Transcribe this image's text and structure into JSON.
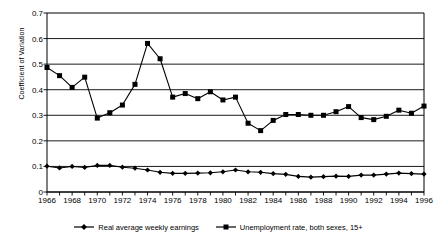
{
  "chart_data": {
    "type": "line",
    "title": "",
    "xlabel": "",
    "ylabel": "Coefficient of Variation",
    "ylim": [
      0,
      0.7
    ],
    "yticks": [
      "0",
      "0.1",
      "0.2",
      "0.3",
      "0.4",
      "0.5",
      "0.6",
      "0.7"
    ],
    "ytick_values": [
      0,
      0.1,
      0.2,
      0.3,
      0.4,
      0.5,
      0.6,
      0.7
    ],
    "xlim": [
      1966,
      1996
    ],
    "x": [
      1966,
      1967,
      1968,
      1969,
      1970,
      1971,
      1972,
      1973,
      1974,
      1975,
      1976,
      1977,
      1978,
      1979,
      1980,
      1981,
      1982,
      1983,
      1984,
      1985,
      1986,
      1987,
      1988,
      1989,
      1990,
      1991,
      1992,
      1993,
      1994,
      1995,
      1996
    ],
    "xticks": [
      "1966",
      "1968",
      "1970",
      "1972",
      "1974",
      "1976",
      "1978",
      "1980",
      "1982",
      "1984",
      "1986",
      "1988",
      "1990",
      "1992",
      "1994",
      "1996"
    ],
    "xtick_values": [
      1966,
      1968,
      1970,
      1972,
      1974,
      1976,
      1978,
      1980,
      1982,
      1984,
      1986,
      1988,
      1990,
      1992,
      1994,
      1996
    ],
    "grid": "horizontal",
    "legend_position": "bottom",
    "series": [
      {
        "name": "Real average weekly earnings",
        "marker": "diamond",
        "color": "#000000",
        "values": [
          0.101,
          0.094,
          0.1,
          0.096,
          0.104,
          0.104,
          0.097,
          0.093,
          0.086,
          0.077,
          0.073,
          0.073,
          0.074,
          0.075,
          0.079,
          0.086,
          0.079,
          0.077,
          0.072,
          0.069,
          0.061,
          0.058,
          0.06,
          0.062,
          0.061,
          0.066,
          0.066,
          0.07,
          0.074,
          0.072,
          0.07
        ]
      },
      {
        "name": "Unemployment rate, both sexes, 15+",
        "marker": "square",
        "color": "#000000",
        "values": [
          0.487,
          0.455,
          0.409,
          0.449,
          0.289,
          0.31,
          0.34,
          0.421,
          0.581,
          0.521,
          0.371,
          0.385,
          0.365,
          0.392,
          0.36,
          0.371,
          0.269,
          0.24,
          0.28,
          0.303,
          0.303,
          0.3,
          0.3,
          0.314,
          0.334,
          0.291,
          0.283,
          0.296,
          0.32,
          0.308,
          0.336
        ]
      }
    ]
  }
}
